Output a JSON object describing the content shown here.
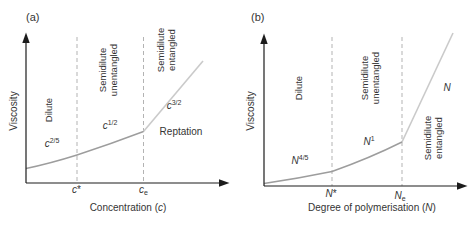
{
  "colors": {
    "axis": "#1c1c1c",
    "curve": "#9d9d9d",
    "steep_line": "#cacaca",
    "dashed_line": "#b3b3b3",
    "text": "#343434"
  },
  "panel_a": {
    "tag": "(a)",
    "y_axis_label": "Viscosity",
    "x_axis_label": {
      "prefix": "Concentration (",
      "variable": "c",
      "suffix": ")"
    },
    "regions": {
      "dilute": "Dilute",
      "semidilute_unentangled": "Semidilute unentangled",
      "semidilute_entangled": "Semidilute entangled"
    },
    "scaling_labels": {
      "dilute": {
        "base": "c",
        "exp": "2/5"
      },
      "semidilute_unentangled": {
        "base": "c",
        "exp": "1/2"
      },
      "semidilute_entangled": {
        "base": "c",
        "exp": "3/2"
      }
    },
    "mechanism_label": "Reptation",
    "ticks": {
      "overlap": {
        "base": "c",
        "mark": "*"
      },
      "entanglement": {
        "base": "c",
        "sub": "e"
      }
    }
  },
  "panel_b": {
    "tag": "(b)",
    "y_axis_label": "Viscosity",
    "x_axis_label": {
      "prefix": "Degree of polymerisation (",
      "variable": "N",
      "suffix": ")"
    },
    "regions": {
      "dilute": "Dilute",
      "semidilute_unentangled": "Semidilute unentangled",
      "semidilute_entangled": "Semidilute entangled"
    },
    "scaling_labels": {
      "dilute": {
        "base": "N",
        "exp": "4/5"
      },
      "semidilute_unentangled": {
        "base": "N",
        "exp": "1"
      },
      "semidilute_entangled": {
        "base": "N",
        "exp": ""
      }
    },
    "ticks": {
      "overlap": {
        "base": "N",
        "mark": "*"
      },
      "entanglement": {
        "base": "N",
        "sub": "e"
      }
    }
  }
}
